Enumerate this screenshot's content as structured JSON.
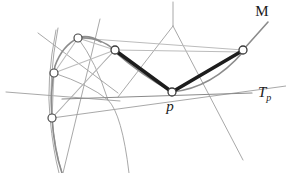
{
  "figure": {
    "background_color": "#ffffff",
    "width": 286,
    "height": 173,
    "labels": [
      {
        "id": "manifold",
        "text": "M",
        "x": 262,
        "y": 16,
        "style": "upright",
        "size": 15
      },
      {
        "id": "tangent-space",
        "text": "T",
        "sub": "p",
        "x": 258,
        "y": 97,
        "style": "italic",
        "size": 14
      },
      {
        "id": "base-point",
        "text": "p",
        "x": 170,
        "y": 110,
        "style": "italic",
        "size": 14
      }
    ],
    "nodes": [
      {
        "id": "node-top-left",
        "x": 78,
        "y": 38,
        "r": 4
      },
      {
        "id": "node-mid-left",
        "x": 54,
        "y": 73,
        "r": 4
      },
      {
        "id": "node-bottom-left",
        "x": 52,
        "y": 118,
        "r": 4
      },
      {
        "id": "node-upper-mid",
        "x": 115,
        "y": 50,
        "r": 4
      },
      {
        "id": "node-p",
        "x": 172,
        "y": 92,
        "r": 4
      },
      {
        "id": "node-right",
        "x": 243,
        "y": 50,
        "r": 4
      }
    ],
    "colors": {
      "geodesic_thick": "#1d1d1d",
      "surface_curve": "#8c8c8c",
      "grid_line": "#9a9a9a",
      "light_grid_line": "#b9b9b9",
      "tangent_line": "#8a8a8a",
      "node_stroke": "#4a4a4a",
      "node_fill": "#ffffff",
      "label_color": "#1a1a1a"
    },
    "strokes": {
      "geodesic_thick_width": 3.4,
      "surface_curve_width": 1.5,
      "grid_width": 0.9,
      "tangent_width": 1.0
    },
    "elements": {
      "geodesic_left_label": "geodesic segment from upper-mid node to p",
      "geodesic_right_label": "geodesic segment from p to right node",
      "tangent_line_label": "tangent line T_p at point p",
      "manifold_curve_label": "manifold boundary curve M",
      "surface_mesh_label": "surface coordinate mesh"
    }
  }
}
